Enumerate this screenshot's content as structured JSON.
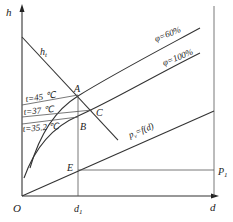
{
  "axes": {
    "y_label": "h",
    "x_label": "d",
    "origin_label": "O",
    "x_tick_label": "d",
    "x_tick_sub": "1"
  },
  "curves": {
    "phi60": "φ=60%",
    "phi100": "φ=100%",
    "pv": "p",
    "pv_sub": "v",
    "pv_rest": "=f(d)",
    "ht": "h",
    "ht_sub": "t"
  },
  "isotherms": [
    {
      "label": "t=45 ℃"
    },
    {
      "label": "t=37 ℃"
    },
    {
      "label": "t=35.2 ℃"
    }
  ],
  "points": {
    "A": "A",
    "B": "B",
    "C": "C",
    "E": "E",
    "P1": "P",
    "P1_sub": "1"
  },
  "colors": {
    "line": "#333333",
    "background": "#ffffff"
  }
}
